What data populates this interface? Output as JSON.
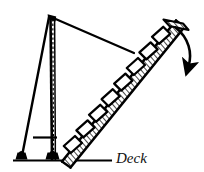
{
  "figure": {
    "background_color": "#ffffff",
    "ink_color": "#111111",
    "line_color": "#000000",
    "hatch_color": "#1a1a1a"
  },
  "labels": {
    "deck": "Deck"
  },
  "parts": [
    {
      "name": "davit-mast",
      "label": "davit mast",
      "kind": "vertical-post"
    },
    {
      "name": "mast-centerline",
      "label": "mast centerline",
      "kind": "dashed-line"
    },
    {
      "name": "support-leg",
      "label": "support leg",
      "kind": "strut"
    },
    {
      "name": "suspension-cable",
      "label": "suspension cable",
      "kind": "cable"
    },
    {
      "name": "accommodation-ladder",
      "label": "accommodation ladder",
      "kind": "hatched-stairway"
    },
    {
      "name": "ladder-steps",
      "label": "ladder steps",
      "kind": "treads"
    },
    {
      "name": "upper-platform",
      "label": "upper platform",
      "kind": "platform"
    },
    {
      "name": "swing-arrow",
      "label": "swing direction",
      "kind": "curved-arrow"
    },
    {
      "name": "deck-line",
      "label": "deck line",
      "kind": "baseline"
    },
    {
      "name": "pivot-foot-left",
      "label": "left pivot foot",
      "kind": "foot"
    },
    {
      "name": "pivot-foot-right",
      "label": "right pivot foot",
      "kind": "foot"
    },
    {
      "name": "cross-brace",
      "label": "cross brace",
      "kind": "crossbar"
    }
  ],
  "geometry": {
    "apex": {
      "x": 50,
      "y": 16
    },
    "mast_base": {
      "x": 52,
      "y": 159
    },
    "leg_foot": {
      "x": 21,
      "y": 158
    },
    "cable_end": {
      "x": 133,
      "y": 52
    },
    "ladder_bottom": {
      "x": 62,
      "y": 160
    },
    "ladder_top": {
      "x": 178,
      "y": 22
    },
    "deck_line": {
      "x1": 13,
      "x2": 112,
      "y": 160
    },
    "crossbar": {
      "x1": 33,
      "x2": 57,
      "y": 137
    },
    "arrow_start": {
      "x": 176,
      "y": 28
    },
    "arrow_end": {
      "x": 188,
      "y": 72
    },
    "step_count": 9
  }
}
